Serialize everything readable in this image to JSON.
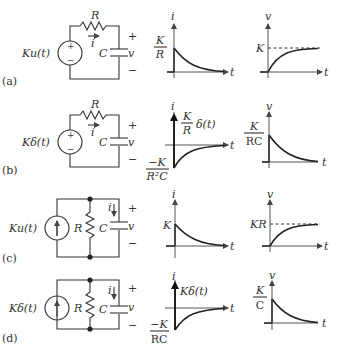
{
  "rows": [
    {
      "tag": "(a)",
      "source_label": "Ku(t)",
      "source_type": "voltage",
      "resistor_label": "R",
      "capacitor_label": "C",
      "current_label": "i",
      "voltage_label": "v",
      "plus": "+",
      "minus": "−",
      "i_plot": {
        "axis_y": "i",
        "axis_x": "t",
        "level_num": "K",
        "level_den": "R"
      },
      "v_plot": {
        "axis_y": "v",
        "axis_x": "t",
        "level": "K"
      }
    },
    {
      "tag": "(b)",
      "source_label": "Kδ(t)",
      "source_type": "voltage",
      "resistor_label": "R",
      "capacitor_label": "C",
      "current_label": "i",
      "voltage_label": "v",
      "plus": "+",
      "minus": "−",
      "i_plot": {
        "axis_y": "i",
        "axis_x": "t",
        "impulse_num": "K",
        "impulse_den": "R",
        "impulse_suffix": "δ(t)",
        "neg_num": "−K",
        "neg_den": "R²C"
      },
      "v_plot": {
        "axis_y": "v",
        "axis_x": "t",
        "level_num": "K",
        "level_den": "RC"
      }
    },
    {
      "tag": "(c)",
      "source_label": "Ku(t)",
      "source_type": "current",
      "resistor_label": "R",
      "capacitor_label": "C",
      "current_label": "i",
      "voltage_label": "v",
      "plus": "+",
      "minus": "−",
      "i_plot": {
        "axis_y": "i",
        "axis_x": "t",
        "level": "K"
      },
      "v_plot": {
        "axis_y": "v",
        "axis_x": "t",
        "level": "KR"
      }
    },
    {
      "tag": "(d)",
      "source_label": "Kδ(t)",
      "source_type": "current",
      "resistor_label": "R",
      "capacitor_label": "C",
      "current_label": "i",
      "voltage_label": "v",
      "plus": "+",
      "minus": "−",
      "i_plot": {
        "axis_y": "i",
        "axis_x": "t",
        "impulse_label": "Kδ(t)",
        "neg_num": "−K",
        "neg_den": "RC"
      },
      "v_plot": {
        "axis_y": "v",
        "axis_x": "t",
        "level_num": "K",
        "level_den": "C"
      }
    }
  ]
}
